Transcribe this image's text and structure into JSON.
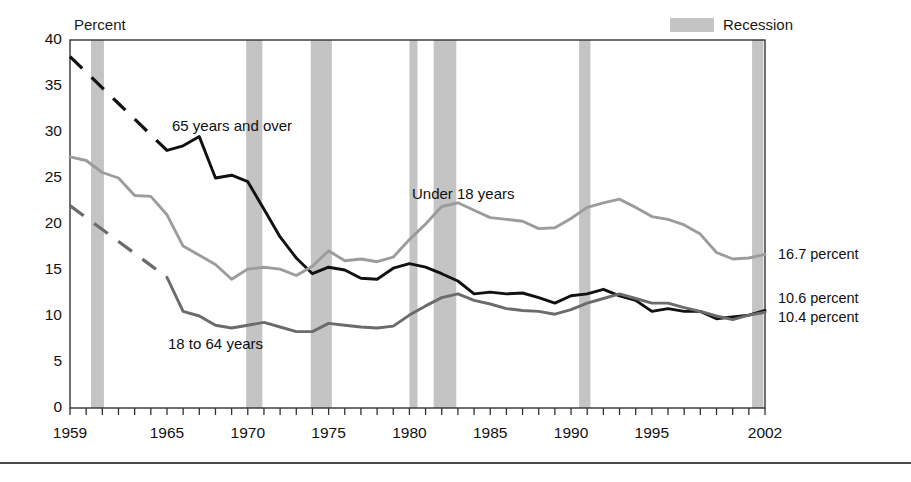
{
  "axis_title": "Percent",
  "legend": {
    "label": "Recession",
    "swatch_color": "#c4c4c4"
  },
  "yticks": [
    "0",
    "5",
    "10",
    "15",
    "20",
    "25",
    "30",
    "35",
    "40"
  ],
  "xticks": [
    "1959",
    "1965",
    "1970",
    "1975",
    "1980",
    "1985",
    "1990",
    "1995",
    "2002"
  ],
  "series_labels": {
    "over65": "65 years and over",
    "under18": "Under 18 years",
    "adults": "18 to 64 years"
  },
  "end_labels": {
    "under18": "16.7 percent",
    "over65": "10.6 percent",
    "adults": "10.4 percent"
  },
  "chart_data": {
    "type": "line",
    "title": "",
    "xlabel": "",
    "ylabel": "Percent",
    "xlim": [
      1959,
      2002
    ],
    "ylim": [
      0,
      40
    ],
    "ytick_values": [
      0,
      5,
      10,
      15,
      20,
      25,
      30,
      35,
      40
    ],
    "xtick_values": [
      1959,
      1965,
      1970,
      1975,
      1980,
      1985,
      1990,
      1995,
      2002
    ],
    "grid": false,
    "legend_position": "top-right",
    "x": [
      1959,
      1960,
      1961,
      1962,
      1963,
      1964,
      1965,
      1966,
      1967,
      1968,
      1969,
      1970,
      1971,
      1972,
      1973,
      1974,
      1975,
      1976,
      1977,
      1978,
      1979,
      1980,
      1981,
      1982,
      1983,
      1984,
      1985,
      1986,
      1987,
      1988,
      1989,
      1990,
      1991,
      1992,
      1993,
      1994,
      1995,
      1996,
      1997,
      1998,
      1999,
      2000,
      2001,
      2002
    ],
    "series": [
      {
        "name": "65 years and over",
        "color": "#111111",
        "dashed_range": [
          1959,
          1965
        ],
        "end_value": 10.6,
        "values": [
          38.2,
          36.5,
          34.8,
          33.1,
          31.4,
          29.7,
          28.0,
          28.5,
          29.5,
          25.0,
          25.3,
          24.6,
          21.6,
          18.6,
          16.3,
          14.6,
          15.3,
          15.0,
          14.1,
          14.0,
          15.2,
          15.7,
          15.3,
          14.6,
          13.8,
          12.4,
          12.6,
          12.4,
          12.5,
          12.0,
          11.4,
          12.2,
          12.4,
          12.9,
          12.2,
          11.7,
          10.5,
          10.8,
          10.5,
          10.5,
          9.7,
          9.9,
          10.1,
          10.6
        ]
      },
      {
        "name": "Under 18 years",
        "color": "#9c9c9c",
        "dashed_range": null,
        "end_value": 16.7,
        "values": [
          27.3,
          26.9,
          25.6,
          25.0,
          23.1,
          23.0,
          21.0,
          17.6,
          16.6,
          15.6,
          14.0,
          15.1,
          15.3,
          15.1,
          14.4,
          15.4,
          17.1,
          16.0,
          16.2,
          15.9,
          16.4,
          18.3,
          20.0,
          21.9,
          22.3,
          21.5,
          20.7,
          20.5,
          20.3,
          19.5,
          19.6,
          20.6,
          21.8,
          22.3,
          22.7,
          21.8,
          20.8,
          20.5,
          19.9,
          18.9,
          16.9,
          16.2,
          16.3,
          16.7
        ]
      },
      {
        "name": "18 to 64 years",
        "color": "#6b6b6b",
        "dashed_range": [
          1959,
          1965
        ],
        "end_value": 10.4,
        "values": [
          22.0,
          20.7,
          19.4,
          18.1,
          16.8,
          15.5,
          14.2,
          10.5,
          10.0,
          9.0,
          8.7,
          9.0,
          9.3,
          8.8,
          8.3,
          8.3,
          9.2,
          9.0,
          8.8,
          8.7,
          8.9,
          10.1,
          11.1,
          12.0,
          12.4,
          11.7,
          11.3,
          10.8,
          10.6,
          10.5,
          10.2,
          10.7,
          11.4,
          11.9,
          12.4,
          11.9,
          11.4,
          11.4,
          10.9,
          10.5,
          10.0,
          9.6,
          10.1,
          10.4
        ]
      }
    ],
    "recessions": [
      {
        "start": 1960.3,
        "end": 1961.1
      },
      {
        "start": 1969.9,
        "end": 1970.9
      },
      {
        "start": 1973.9,
        "end": 1975.2
      },
      {
        "start": 1980.0,
        "end": 1980.5
      },
      {
        "start": 1981.5,
        "end": 1982.9
      },
      {
        "start": 1990.5,
        "end": 1991.2
      },
      {
        "start": 2001.2,
        "end": 2001.9
      }
    ]
  }
}
